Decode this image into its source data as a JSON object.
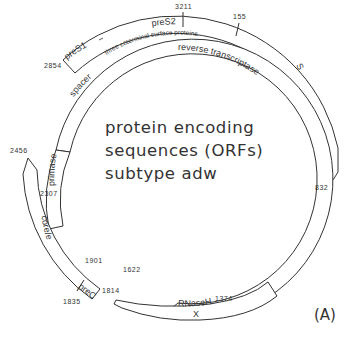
{
  "diagram": {
    "title_lines": [
      "protein encoding",
      "sequences (ORFs)",
      "subtype adw"
    ],
    "panel_label": "(A)",
    "genes": {
      "envelope": {
        "segments": [
          {
            "label": "preS1"
          },
          {
            "label": "preS2"
          },
          {
            "label": "S"
          }
        ],
        "sublabel": "three coterminal surface proteins",
        "positions": {
          "start": "2854",
          "preS2_start": "3211",
          "S_start": "155",
          "end": "832"
        }
      },
      "polymerase": {
        "segments": [
          {
            "label": "primase"
          },
          {
            "label": "spacer"
          },
          {
            "label": "reverse transcriptase"
          },
          {
            "label": "RNaseH"
          }
        ],
        "positions": {
          "start": "2307",
          "end": "1622"
        }
      },
      "core": {
        "segments": [
          {
            "label": "core/e"
          },
          {
            "label": "preC"
          }
        ],
        "positions": {
          "start": "2456",
          "preC_start": "1901",
          "end": "1814"
        }
      },
      "x": {
        "label": "X",
        "positions": {
          "start": "1374",
          "end": "1835"
        }
      }
    },
    "colors": {
      "line": "#333333",
      "background": "#ffffff"
    }
  }
}
